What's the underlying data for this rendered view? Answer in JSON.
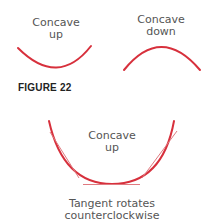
{
  "figure": {
    "title": "FIGURE 22",
    "colors": {
      "curve": "#d7303c",
      "tangent": "#e07a80",
      "text": "#555555"
    },
    "panels": [
      {
        "id": "concave-up-small",
        "label_line1": "Concave",
        "label_line2": "up"
      },
      {
        "id": "concave-down-small",
        "label_line1": "Concave",
        "label_line2": "down"
      },
      {
        "id": "concave-up-large",
        "label_line1": "Concave",
        "label_line2": "up",
        "caption_line1": "Tangent rotates",
        "caption_line2": "counterclockwise"
      }
    ]
  }
}
